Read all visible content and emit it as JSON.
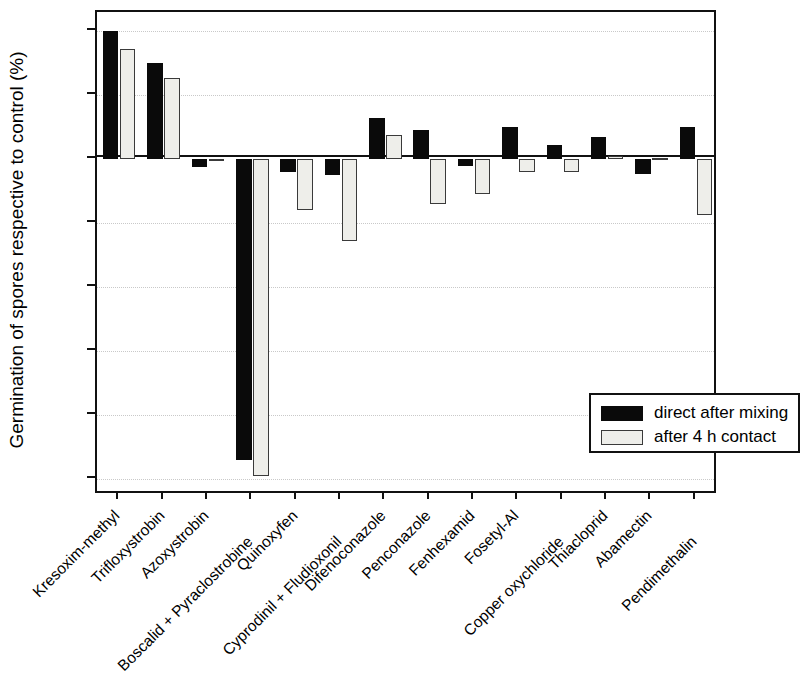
{
  "chart_data": {
    "type": "bar",
    "title": "",
    "xlabel": "",
    "ylabel": "Germination of spores respective to control (%)",
    "ylim": [
      -105,
      46
    ],
    "yticks": [
      40,
      20,
      0,
      -20,
      -40,
      -60,
      -80,
      -100
    ],
    "ytick_labels": [
      "40",
      "20",
      "0",
      "-20",
      "-40",
      "-60",
      "-80",
      "-100"
    ],
    "grid": true,
    "legend_position": "lower right",
    "categories": [
      "Kresoxim-methyl",
      "Trifloxystrobin",
      "Azoxystrobin",
      "Boscalid + Pyraclostrobine",
      "Quinoxyfen",
      "Cyprodinil + Fludioxonil",
      "Difenoconazole",
      "Penconazole",
      "Fenhexamid",
      "Fosetyl-Al",
      "Copper oxychloride",
      "Thiacloprid",
      "Abamectin",
      "Pendimethalin"
    ],
    "series": [
      {
        "name": "direct after mixing",
        "color": "#0a0a0a",
        "values": [
          40,
          30,
          -2.5,
          -94,
          -4,
          -5,
          13,
          9,
          -2,
          10,
          4.5,
          7,
          -4.5,
          10
        ]
      },
      {
        "name": "after 4 h contact",
        "color": "#eeeeea",
        "values": [
          34.5,
          25.5,
          0,
          -99,
          -16,
          -25.5,
          7.5,
          -14,
          -11,
          -4,
          -4,
          1,
          0.5,
          -17.5
        ]
      }
    ]
  },
  "legend": {
    "items": [
      {
        "label": "direct after mixing",
        "swatch": "black"
      },
      {
        "label": "after 4 h contact",
        "swatch": "grey"
      }
    ]
  }
}
